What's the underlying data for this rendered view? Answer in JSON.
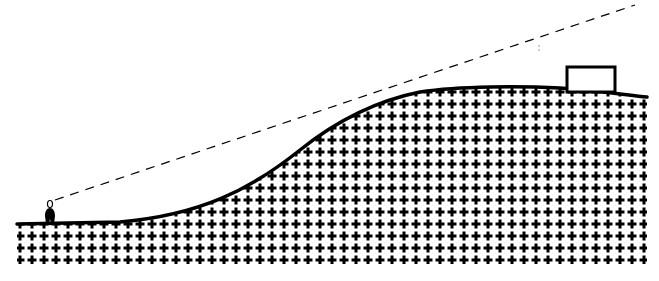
{
  "diagram": {
    "elements": {
      "observer": {
        "label": "person",
        "x": 48,
        "y": 224
      },
      "sight_line": {
        "style": "dashed",
        "from": [
          55,
          200
        ],
        "to": [
          635,
          5
        ]
      },
      "hill": {
        "fill_pattern": "plus-grid",
        "pattern_pitch": 12
      },
      "building": {
        "label": "box",
        "x": 567,
        "y": 67,
        "width": 48,
        "height": 25
      }
    },
    "colors": {
      "ink": "#000000",
      "background": "#ffffff"
    }
  }
}
